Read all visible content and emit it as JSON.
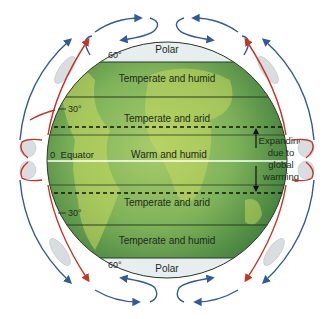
{
  "diagram": {
    "labels": {
      "polar_top": "Polar",
      "polar_bottom": "Polar",
      "lat_60_top": "60°",
      "lat_60_bottom": "60°",
      "lat_30_top": "30°",
      "lat_30_bottom": "30°",
      "equator": "0  Equator",
      "zone_temperate_humid_n": "Temperate and humid",
      "zone_temperate_arid_n": "Temperate and arid",
      "zone_warm_humid": "Warm and humid",
      "zone_temperate_arid_s": "Temperate and arid",
      "zone_temperate_humid_s": "Temperate and humid",
      "expanding_line1": "Expanding",
      "expanding_line2": "due to",
      "expanding_line3": "global",
      "expanding_line4": "warming"
    },
    "colors": {
      "rising_air": "#c8321e",
      "descending_air": "#2f5b9a",
      "globe_green": "#6aa84f",
      "polar_cap": "#e8eef0"
    }
  }
}
